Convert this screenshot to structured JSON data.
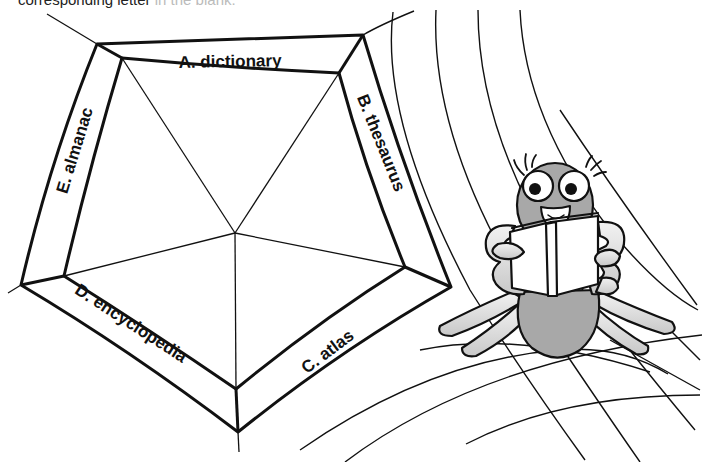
{
  "instruction": {
    "visible_text": "corresponding letter",
    "faded_text": "in the blank."
  },
  "web": {
    "labels": [
      {
        "id": "A",
        "text": "A. dictionary"
      },
      {
        "id": "B",
        "text": "B. thesaurus"
      },
      {
        "id": "C",
        "text": "C. atlas"
      },
      {
        "id": "D",
        "text": "D. encyclopedia"
      },
      {
        "id": "E",
        "text": "E. almanac"
      }
    ]
  },
  "illustration": {
    "character": "spider reading a book",
    "colors": {
      "line": "#111111",
      "body_gray": "#a8a8a8",
      "leg_light": "#e4e4e4",
      "book": "#ffffff"
    }
  }
}
